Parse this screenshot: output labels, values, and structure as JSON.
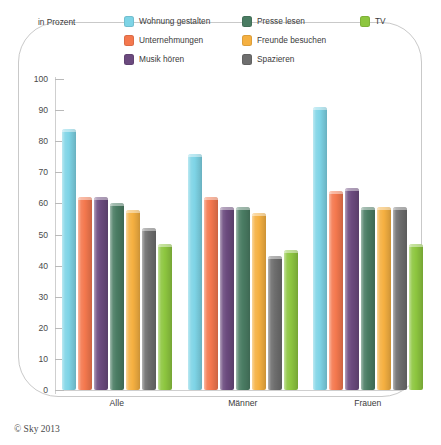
{
  "axis_unit_label": "in Prozent",
  "copyright": "© Sky 2013",
  "legend": {
    "items": [
      {
        "label": "Wohnung gestalten",
        "color": "#7ed4e6",
        "key": "wohnung-gestalten"
      },
      {
        "label": "Unternehmungen",
        "color": "#f4784e",
        "key": "unternehmungen"
      },
      {
        "label": "Musik hören",
        "color": "#6b4a7e",
        "key": "musik-hoeren"
      },
      {
        "label": "Presse lesen",
        "color": "#4a7c63",
        "key": "presse-lesen"
      },
      {
        "label": "Freunde besuchen",
        "color": "#f5b041",
        "key": "freunde-besuchen"
      },
      {
        "label": "Spazieren",
        "color": "#6e6e6e",
        "key": "spazieren"
      },
      {
        "label": "TV",
        "color": "#8dc63f",
        "key": "tv"
      }
    ]
  },
  "chart_data": {
    "type": "bar",
    "title": "",
    "subtitle": "",
    "xlabel": "",
    "ylabel": "in Prozent",
    "ylim": [
      0,
      100
    ],
    "ytick_labels": [
      "0",
      "10",
      "20",
      "30",
      "40",
      "50",
      "60",
      "70",
      "80",
      "90",
      "100"
    ],
    "yticks": [
      0,
      10,
      20,
      30,
      40,
      50,
      60,
      70,
      80,
      90,
      100
    ],
    "grid": false,
    "legend_position": "top",
    "categories": [
      "Alle",
      "Männer",
      "Frauen"
    ],
    "series": [
      {
        "name": "Wohnung gestalten",
        "color": "#7ed4e6",
        "values": [
          84,
          76,
          91
        ]
      },
      {
        "name": "Unternehmungen",
        "color": "#f4784e",
        "values": [
          62,
          62,
          64
        ]
      },
      {
        "name": "Musik hören",
        "color": "#6b4a7e",
        "values": [
          62,
          59,
          65
        ]
      },
      {
        "name": "Presse lesen",
        "color": "#4a7c63",
        "values": [
          60,
          59,
          59
        ]
      },
      {
        "name": "Freunde besuchen",
        "color": "#f5b041",
        "values": [
          58,
          57,
          59
        ]
      },
      {
        "name": "Spazieren",
        "color": "#6e6e6e",
        "values": [
          52,
          43,
          59
        ]
      },
      {
        "name": "TV",
        "color": "#8dc63f",
        "values": [
          47,
          45,
          47
        ]
      }
    ]
  }
}
